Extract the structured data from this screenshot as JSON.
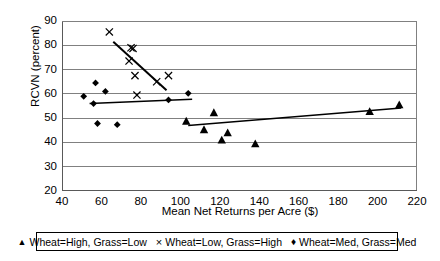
{
  "chart_data": {
    "type": "scatter",
    "title": "",
    "xlabel": "Mean Net Returns per Acre ($)",
    "ylabel": "RCVN (percent)",
    "xlim": [
      40,
      220
    ],
    "ylim": [
      20,
      90
    ],
    "xticks": [
      40,
      60,
      80,
      100,
      120,
      140,
      160,
      180,
      200,
      220
    ],
    "yticks": [
      20,
      30,
      40,
      50,
      60,
      70,
      80,
      90
    ],
    "grid": "horizontal",
    "legend_position": "bottom",
    "series": [
      {
        "name": "Wheat=High, Grass=Low",
        "marker": "triangle",
        "color": "#000000",
        "points": [
          {
            "x": 103,
            "y": 48.8
          },
          {
            "x": 112,
            "y": 45.3
          },
          {
            "x": 117,
            "y": 52.3
          },
          {
            "x": 121,
            "y": 41.0
          },
          {
            "x": 124,
            "y": 44.0
          },
          {
            "x": 138,
            "y": 39.5
          },
          {
            "x": 196,
            "y": 52.8
          },
          {
            "x": 211,
            "y": 55.5
          }
        ],
        "trendline": {
          "x0": 104,
          "y0": 47.0,
          "x1": 212,
          "y1": 54.2
        }
      },
      {
        "name": "Wheat=Low, Grass=High",
        "marker": "cross",
        "color": "#000000",
        "points": [
          {
            "x": 64,
            "y": 85.5
          },
          {
            "x": 75,
            "y": 79.0
          },
          {
            "x": 76,
            "y": 78.7
          },
          {
            "x": 74,
            "y": 73.5
          },
          {
            "x": 77,
            "y": 67.5
          },
          {
            "x": 78,
            "y": 59.5
          },
          {
            "x": 88,
            "y": 65.0
          },
          {
            "x": 94,
            "y": 67.5
          }
        ],
        "trendline": {
          "x0": 66,
          "y0": 81.5,
          "x1": 93,
          "y1": 61.5
        }
      },
      {
        "name": "Wheat=Med, Grass=Med",
        "marker": "diamond",
        "color": "#000000",
        "points": [
          {
            "x": 51,
            "y": 59.0
          },
          {
            "x": 57,
            "y": 64.5
          },
          {
            "x": 56,
            "y": 56.0
          },
          {
            "x": 62,
            "y": 61.0
          },
          {
            "x": 58,
            "y": 47.8
          },
          {
            "x": 68,
            "y": 47.3
          },
          {
            "x": 94,
            "y": 57.5
          },
          {
            "x": 104,
            "y": 60.2
          }
        ],
        "trendline": {
          "x0": 54,
          "y0": 56.0,
          "x1": 106,
          "y1": 57.8
        }
      }
    ]
  },
  "legend": {
    "entries": [
      {
        "marker_glyph": "▲",
        "label": "Wheat=High, Grass=Low"
      },
      {
        "marker_glyph": "×",
        "label": "Wheat=Low, Grass=High"
      },
      {
        "marker_glyph": "♦",
        "label": "Wheat=Med, Grass=Med"
      }
    ]
  },
  "axes": {
    "y_title": "RCVN (percent)",
    "x_title": "Mean Net Returns per Acre ($)"
  }
}
